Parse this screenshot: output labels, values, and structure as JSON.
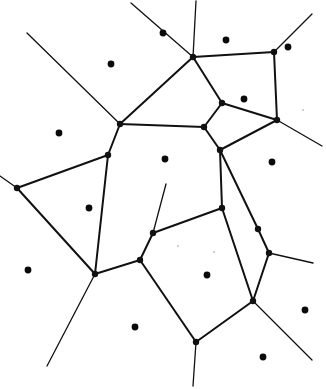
{
  "figure": {
    "kind": "voronoi-diagram",
    "width": 326,
    "height": 389,
    "background_color": "#ffffff",
    "line_color": "#111111",
    "site_color": "#0a0a0a",
    "line_width_main": 2.0,
    "line_width_thin": 1.3,
    "site_radius": 3.4,
    "vertex_radius": 3.2
  },
  "diagram_data": {
    "type": "diagram",
    "description": "Hand-drawn style planar Voronoi tessellation: black filled dots mark generator sites and thin black polylines mark the cell boundaries, with several edges running off the image border.",
    "sites": [
      {
        "id": "s1",
        "x": 111,
        "y": 64
      },
      {
        "id": "s2",
        "x": 163,
        "y": 33
      },
      {
        "id": "s3",
        "x": 226,
        "y": 40
      },
      {
        "id": "s4",
        "x": 288,
        "y": 47
      },
      {
        "id": "s5",
        "x": 244,
        "y": 99
      },
      {
        "id": "s6",
        "x": 59,
        "y": 133
      },
      {
        "id": "s7",
        "x": 165,
        "y": 159
      },
      {
        "id": "s8",
        "x": 272,
        "y": 162
      },
      {
        "id": "s9",
        "x": 89,
        "y": 208
      },
      {
        "id": "s10",
        "x": 207,
        "y": 275
      },
      {
        "id": "s11",
        "x": 28,
        "y": 270
      },
      {
        "id": "s12",
        "x": 305,
        "y": 310
      },
      {
        "id": "s13",
        "x": 135,
        "y": 327
      },
      {
        "id": "s14",
        "x": 263,
        "y": 357
      }
    ],
    "vertices": [
      {
        "id": "v1",
        "x": 193,
        "y": 57
      },
      {
        "id": "v2",
        "x": 274,
        "y": 52
      },
      {
        "id": "v3",
        "x": 120,
        "y": 124
      },
      {
        "id": "v4",
        "x": 204,
        "y": 127
      },
      {
        "id": "v5",
        "x": 222,
        "y": 103
      },
      {
        "id": "v6",
        "x": 277,
        "y": 120
      },
      {
        "id": "v7",
        "x": 108,
        "y": 155
      },
      {
        "id": "v8",
        "x": 220,
        "y": 150
      },
      {
        "id": "v9",
        "x": 222,
        "y": 208
      },
      {
        "id": "v10",
        "x": 17,
        "y": 188
      },
      {
        "id": "v11",
        "x": 95,
        "y": 274
      },
      {
        "id": "v12",
        "x": 140,
        "y": 260
      },
      {
        "id": "v13",
        "x": 153,
        "y": 233
      },
      {
        "id": "v14",
        "x": 258,
        "y": 229
      },
      {
        "id": "v15",
        "x": 269,
        "y": 253
      },
      {
        "id": "v16",
        "x": 253,
        "y": 301
      },
      {
        "id": "v17",
        "x": 196,
        "y": 342
      }
    ],
    "edges": [
      {
        "from": "border-left-top",
        "to": "v3",
        "path": "M 27,33 L 120,124"
      },
      {
        "from": "border-top",
        "to": "v1",
        "path": "M 131,3 L 193,57"
      },
      {
        "from": "border-top",
        "to": "v1",
        "path": "M 196,1 L 193,57"
      },
      {
        "from": "v1",
        "to": "v3",
        "path": "M 193,57 L 120,124"
      },
      {
        "from": "v1",
        "to": "v5",
        "path": "M 193,57 L 222,103"
      },
      {
        "from": "v1",
        "to": "v2",
        "path": "M 193,57 L 274,52"
      },
      {
        "from": "v2",
        "to": "border-top-right",
        "path": "M 274,52 L 312,14"
      },
      {
        "from": "v2",
        "to": "v6",
        "path": "M 274,52 L 277,120"
      },
      {
        "from": "v5",
        "to": "v4",
        "path": "M 222,103 L 204,127"
      },
      {
        "from": "v5",
        "to": "v6",
        "path": "M 222,103 L 277,120"
      },
      {
        "from": "v3",
        "to": "v4",
        "path": "M 120,124 L 204,127"
      },
      {
        "from": "v3",
        "to": "v7",
        "path": "M 120,124 L 108,155"
      },
      {
        "from": "v4",
        "to": "v8",
        "path": "M 204,127 L 220,150"
      },
      {
        "from": "v6",
        "to": "border-right",
        "path": "M 277,120 L 322,146"
      },
      {
        "from": "v6",
        "to": "v8",
        "path": "M 277,120 L 220,150"
      },
      {
        "from": "v7",
        "to": "v10",
        "path": "M 108,155 L 17,188"
      },
      {
        "from": "v7",
        "to": "v11",
        "path": "M 108,155 L 95,274"
      },
      {
        "from": "v8",
        "to": "v9",
        "path": "M 220,150 L 222,208"
      },
      {
        "from": "v8",
        "to": "v14",
        "path": "M 220,150 L 258,229"
      },
      {
        "from": "v9",
        "to": "v13",
        "path": "M 222,208 L 153,233"
      },
      {
        "from": "v9",
        "to": "v16",
        "path": "M 222,208 L 253,301"
      },
      {
        "from": "v10",
        "to": "border-left",
        "path": "M 17,188 L 0,176"
      },
      {
        "from": "v10",
        "to": "v11",
        "path": "M 17,188 L 95,274"
      },
      {
        "from": "v13",
        "to": "v12",
        "path": "M 153,233 L 140,260"
      },
      {
        "from": "v12",
        "to": "v11",
        "path": "M 140,260 L 95,274"
      },
      {
        "from": "v12",
        "to": "v17",
        "path": "M 140,260 L 196,342"
      },
      {
        "from": "v11",
        "to": "border-bottom",
        "path": "M 95,274 L 47,366"
      },
      {
        "from": "v13",
        "to": "border-top-between",
        "path": "M 153,233 L 166,184"
      },
      {
        "from": "v14",
        "to": "v15",
        "path": "M 258,229 L 269,253"
      },
      {
        "from": "v15",
        "to": "border-right",
        "path": "M 269,253 L 313,263"
      },
      {
        "from": "v15",
        "to": "v16",
        "path": "M 269,253 L 253,301"
      },
      {
        "from": "v16",
        "to": "v17",
        "path": "M 253,301 L 196,342"
      },
      {
        "from": "v16",
        "to": "border-bottom-right",
        "path": "M 253,301 L 312,360"
      },
      {
        "from": "v17",
        "to": "border-bottom",
        "path": "M 196,342 L 193,386"
      }
    ],
    "specks": [
      {
        "x": 303,
        "y": 110
      },
      {
        "x": 178,
        "y": 246
      },
      {
        "x": 214,
        "y": 252
      }
    ]
  }
}
